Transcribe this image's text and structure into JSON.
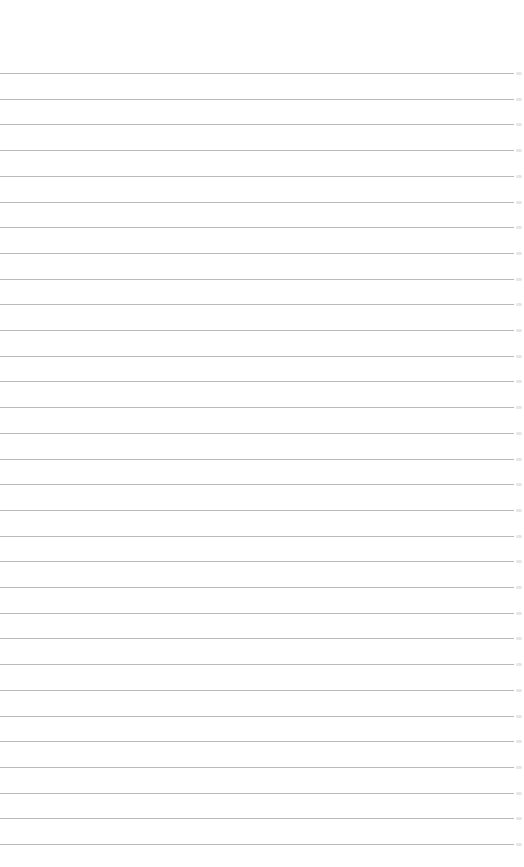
{
  "page": {
    "type": "lined-paper",
    "background_color": "#ffffff",
    "line_color": "#b9b9b9",
    "line_count": 31,
    "first_line_y": 73,
    "line_spacing": 25.7,
    "line_width": 514,
    "lines": [
      "",
      "",
      "",
      "",
      "",
      "",
      "",
      "",
      "",
      "",
      "",
      "",
      "",
      "",
      "",
      "",
      "",
      "",
      "",
      "",
      "",
      "",
      "",
      "",
      "",
      "",
      "",
      "",
      "",
      "",
      ""
    ]
  }
}
